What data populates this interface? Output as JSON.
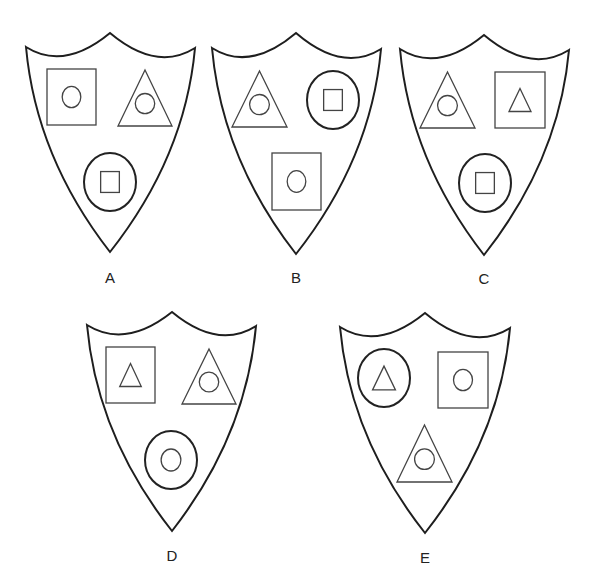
{
  "figure": {
    "title": "",
    "shields": [
      {
        "label": "A",
        "corners": {
          "left": [
            26,
            47
          ],
          "peak": [
            110,
            33
          ],
          "right": [
            195,
            48
          ],
          "tip": [
            110,
            252
          ]
        },
        "label_pos": [
          110,
          283
        ],
        "slots": [
          {
            "position": "top-left",
            "outer": "square",
            "inner": "circle",
            "box": [
              47,
              69,
              96,
              125
            ]
          },
          {
            "position": "top-right",
            "outer": "triangle",
            "inner": "circle",
            "box": [
              118,
              70,
              172,
              126
            ]
          },
          {
            "position": "bottom",
            "outer": "circle",
            "inner": "square",
            "box": [
              84,
              153,
              136,
              211
            ]
          }
        ]
      },
      {
        "label": "B",
        "corners": {
          "left": [
            212,
            48
          ],
          "peak": [
            296,
            33
          ],
          "right": [
            381,
            49
          ],
          "tip": [
            296,
            254
          ]
        },
        "label_pos": [
          296,
          283
        ],
        "slots": [
          {
            "position": "top-left",
            "outer": "triangle",
            "inner": "circle",
            "box": [
              232,
              71,
              287,
              127
            ]
          },
          {
            "position": "top-right",
            "outer": "circle",
            "inner": "square",
            "box": [
              307,
              71,
              359,
              129
            ]
          },
          {
            "position": "bottom",
            "outer": "square",
            "inner": "circle",
            "box": [
              272,
              153,
              321,
              210
            ]
          }
        ]
      },
      {
        "label": "C",
        "corners": {
          "left": [
            400,
            49
          ],
          "peak": [
            484,
            35
          ],
          "right": [
            569,
            50
          ],
          "tip": [
            484,
            255
          ]
        },
        "label_pos": [
          484,
          284
        ],
        "slots": [
          {
            "position": "top-left",
            "outer": "triangle",
            "inner": "circle",
            "box": [
              420,
              72,
              475,
              128
            ]
          },
          {
            "position": "top-right",
            "outer": "square",
            "inner": "triangle",
            "box": [
              495,
              72,
              545,
              128
            ]
          },
          {
            "position": "bottom",
            "outer": "circle",
            "inner": "square",
            "box": [
              459,
              154,
              511,
              212
            ]
          }
        ]
      },
      {
        "label": "D",
        "corners": {
          "left": [
            87,
            325
          ],
          "peak": [
            172,
            312
          ],
          "right": [
            256,
            326
          ],
          "tip": [
            172,
            531
          ]
        },
        "label_pos": [
          172,
          561
        ],
        "slots": [
          {
            "position": "top-left",
            "outer": "square",
            "inner": "triangle",
            "box": [
              106,
              347,
              155,
              403
            ]
          },
          {
            "position": "top-right",
            "outer": "triangle",
            "inner": "circle",
            "box": [
              182,
              349,
              236,
              404
            ]
          },
          {
            "position": "bottom",
            "outer": "circle",
            "inner": "circle",
            "box": [
              145,
              431,
              197,
              489
            ]
          }
        ]
      },
      {
        "label": "E",
        "corners": {
          "left": [
            340,
            327
          ],
          "peak": [
            425,
            313
          ],
          "right": [
            510,
            328
          ],
          "tip": [
            425,
            533
          ]
        },
        "label_pos": [
          425,
          563
        ],
        "slots": [
          {
            "position": "top-left",
            "outer": "circle",
            "inner": "triangle",
            "box": [
              358,
              349,
              410,
              407
            ]
          },
          {
            "position": "top-right",
            "outer": "square",
            "inner": "circle",
            "box": [
              438,
              352,
              488,
              408
            ]
          },
          {
            "position": "bottom",
            "outer": "triangle",
            "inner": "circle",
            "box": [
              397,
              425,
              452,
              482
            ]
          }
        ]
      }
    ]
  }
}
